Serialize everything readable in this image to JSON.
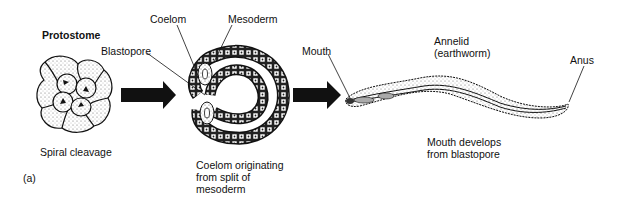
{
  "figure": {
    "panel_label": "(a)",
    "title": "Protostome",
    "stages": [
      {
        "name": "embryo",
        "label": "Spiral cleavage",
        "pointer_labels": [
          "Blastopore"
        ]
      },
      {
        "name": "coelom-formation",
        "label_lines": [
          "Coelom originating",
          "from split of",
          "mesoderm"
        ],
        "pointer_labels": [
          "Coelom",
          "Mesoderm"
        ]
      },
      {
        "name": "adult",
        "title_lines": [
          "Annelid",
          "(earthworm)"
        ],
        "label_lines": [
          "Mouth develops",
          "from blastopore"
        ],
        "pointer_labels": [
          "Mouth",
          "Anus"
        ]
      }
    ],
    "arrows": 2,
    "colors": {
      "ink": "#111111",
      "background": "#ffffff"
    }
  }
}
